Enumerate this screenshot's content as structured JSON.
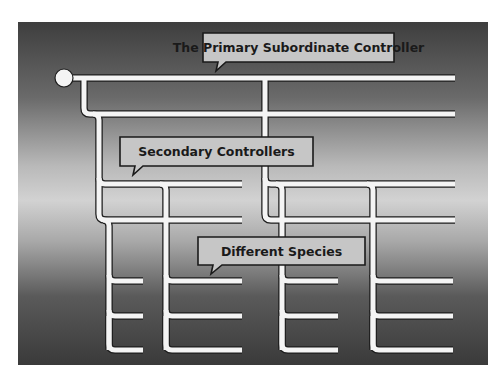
{
  "diagram": {
    "callouts": [
      {
        "id": "primary",
        "label": "The Primary Subordinate Controller"
      },
      {
        "id": "secondary",
        "label": "Secondary Controllers"
      },
      {
        "id": "species",
        "label": "Different Species"
      }
    ],
    "colors": {
      "pipe_fill": "#f4f4f4",
      "pipe_outline": "#1e1e1e",
      "callout_fill": "#c6c6c6",
      "callout_border": "#1a1a1a",
      "text": "#1a1a1a"
    }
  }
}
